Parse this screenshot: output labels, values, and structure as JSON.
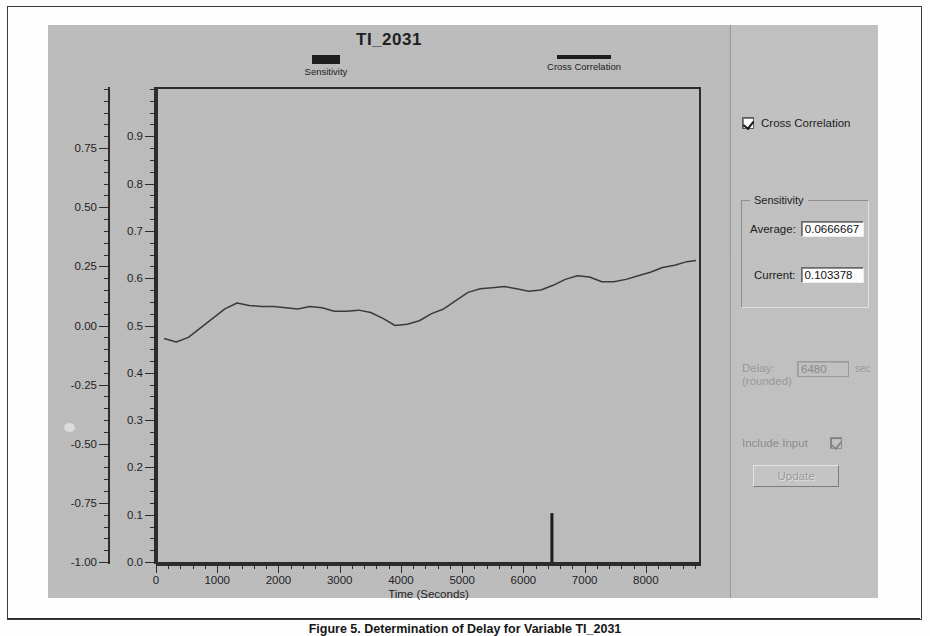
{
  "window": {
    "chart_title": "TI_2031"
  },
  "legend": [
    {
      "name": "sensitivity",
      "label": "Sensitivity",
      "style": "bar",
      "color": "#1c1c1c"
    },
    {
      "name": "cross-correlation",
      "label": "Cross Correlation",
      "style": "line",
      "color": "#1c1c1c"
    }
  ],
  "panel": {
    "cross_correlation": {
      "label": "Cross Correlation",
      "checked": true,
      "enabled": true
    },
    "sensitivity_group": {
      "title": "Sensitivity",
      "average_label": "Average:",
      "average_value": "0.0666667",
      "current_label": "Current:",
      "current_value": "0.103378"
    },
    "delay": {
      "label_line1": "Delay:",
      "label_line2": "(rounded)",
      "value": "6480",
      "unit": "sec",
      "enabled": false
    },
    "include_input": {
      "label": "Include Input",
      "checked": true,
      "enabled": false
    },
    "update_button": {
      "label": "Update",
      "enabled": false
    }
  },
  "caption": "Figure 5.  Determination of Delay for Variable TI_2031",
  "chart_data": {
    "type": "line",
    "title": "TI_2031",
    "xlabel": "Time (Seconds)",
    "ylabel_left": "",
    "ylabel_right": "",
    "xlim": [
      0,
      8900
    ],
    "xticks": [
      0,
      1000,
      2000,
      3000,
      4000,
      5000,
      6000,
      7000,
      8000
    ],
    "xtick_labels": [
      "0",
      "1000",
      "2000",
      "3000",
      "4000",
      "5000",
      "6000",
      "7000",
      "8000"
    ],
    "x_minor_step": 200,
    "axes": [
      {
        "name": "cross-correlation-axis",
        "lim": [
          -1.0,
          1.0
        ],
        "ticks": [
          0.75,
          0.5,
          0.25,
          0.0,
          -0.25,
          -0.5,
          -0.75,
          -1.0
        ],
        "tick_labels": [
          "0.75",
          "0.50",
          "0.25",
          "0.00",
          "-0.25",
          "-0.50",
          "-0.75",
          "-1.00"
        ],
        "minor_step": 0.05
      },
      {
        "name": "sensitivity-axis",
        "lim": [
          0.0,
          1.0
        ],
        "ticks": [
          0.9,
          0.8,
          0.7,
          0.6,
          0.5,
          0.4,
          0.3,
          0.2,
          0.1,
          0.0
        ],
        "tick_labels": [
          "0.9",
          "0.8",
          "0.7",
          "0.6",
          "0.5",
          "0.4",
          "0.3",
          "0.2",
          "0.1",
          "0.0"
        ],
        "minor_step": 0.025
      }
    ],
    "grid": false,
    "legend_position": "above-plot",
    "series": [
      {
        "name": "Cross Correlation",
        "type": "line",
        "axis": "cross-correlation-axis",
        "color": "#3a3a3a",
        "x": [
          100,
          300,
          500,
          700,
          900,
          1100,
          1300,
          1500,
          1700,
          1900,
          2100,
          2300,
          2500,
          2700,
          2900,
          3100,
          3300,
          3500,
          3700,
          3900,
          4100,
          4300,
          4500,
          4700,
          4900,
          5100,
          5300,
          5500,
          5700,
          5900,
          6100,
          6300,
          6500,
          6700,
          6900,
          7100,
          7300,
          7500,
          7700,
          7900,
          8100,
          8300,
          8500,
          8700,
          8850
        ],
        "y": [
          -0.055,
          -0.07,
          -0.05,
          -0.01,
          0.03,
          0.07,
          0.095,
          0.085,
          0.08,
          0.08,
          0.075,
          0.07,
          0.08,
          0.075,
          0.06,
          0.06,
          0.065,
          0.055,
          0.03,
          0.0,
          0.005,
          0.02,
          0.05,
          0.07,
          0.105,
          0.14,
          0.155,
          0.16,
          0.165,
          0.155,
          0.145,
          0.15,
          0.17,
          0.195,
          0.21,
          0.205,
          0.185,
          0.185,
          0.195,
          0.21,
          0.225,
          0.245,
          0.255,
          0.27,
          0.275
        ]
      },
      {
        "name": "Sensitivity",
        "type": "bar",
        "axis": "sensitivity-axis",
        "color": "#1c1c1c",
        "x": [
          6480
        ],
        "y": [
          0.103378
        ]
      }
    ]
  }
}
